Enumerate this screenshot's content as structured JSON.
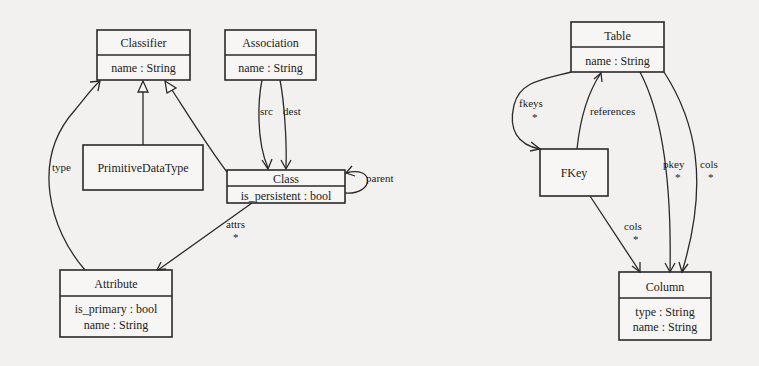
{
  "diagram": {
    "left_model": {
      "classifier": {
        "name": "Classifier",
        "attributes": [
          "name : String"
        ]
      },
      "association": {
        "name": "Association",
        "attributes": [
          "name : String"
        ]
      },
      "primitive": {
        "name": "PrimitiveDataType"
      },
      "class": {
        "name": "Class",
        "attributes": [
          "is_persistent : bool"
        ]
      },
      "attribute": {
        "name": "Attribute",
        "attributes": [
          "is_primary : bool",
          "name : String"
        ]
      },
      "edges": {
        "src": "src",
        "dest": "dest",
        "parent": "parent",
        "attrs": "attrs",
        "attrs_mult": "*",
        "type": "type"
      }
    },
    "right_model": {
      "table": {
        "name": "Table",
        "attributes": [
          "name : String"
        ]
      },
      "fkey": {
        "name": "FKey"
      },
      "column": {
        "name": "Column",
        "attributes": [
          "type : String",
          "name : String"
        ]
      },
      "edges": {
        "fkeys": "fkeys",
        "fkeys_mult": "*",
        "references": "references",
        "pkey": "pkey",
        "pkey_mult": "*",
        "cols_table": "cols",
        "cols_table_mult": "*",
        "cols_fkey": "cols",
        "cols_fkey_mult": "*"
      }
    }
  }
}
